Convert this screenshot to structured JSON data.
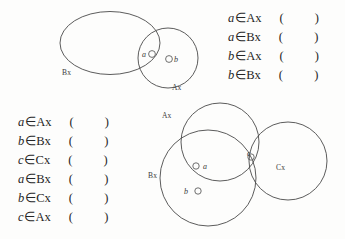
{
  "page": {
    "width": 345,
    "height": 239,
    "background": "#fdfdfc",
    "ink_color": "#3a3a3a",
    "text_color": "#262626"
  },
  "diagrams": {
    "two_set": {
      "name": "two-set-venn-diagram",
      "sets": [
        {
          "id": "Bx",
          "label": "Bx",
          "shape": "ellipse"
        },
        {
          "id": "Ax",
          "label": "Ax",
          "shape": "circle"
        }
      ],
      "points": [
        {
          "id": "a",
          "label": "a",
          "region": "Ax and Bx overlap"
        },
        {
          "id": "b",
          "label": "b",
          "region": "Ax only"
        }
      ]
    },
    "three_set": {
      "name": "three-set-venn-diagram",
      "sets": [
        {
          "id": "Ax",
          "label": "Ax",
          "shape": "circle"
        },
        {
          "id": "Bx",
          "label": "Bx",
          "shape": "circle"
        },
        {
          "id": "Cx",
          "label": "Cx",
          "shape": "circle"
        }
      ],
      "points": [
        {
          "id": "a",
          "label": "a",
          "region": "Ax and Bx overlap"
        },
        {
          "id": "b",
          "label": "b",
          "region": "Bx only"
        },
        {
          "id": "c",
          "label": "c",
          "region": "Ax and Cx overlap"
        }
      ]
    }
  },
  "membership_symbol": "∈",
  "answer_blank": "(  )",
  "lists": {
    "top_right": {
      "name": "membership-statements-top-right",
      "rows": [
        {
          "var": "a",
          "op": "∈",
          "set": "Ax",
          "blank": "(    )"
        },
        {
          "var": "a",
          "op": "∈",
          "set": "Bx",
          "blank": "(    )"
        },
        {
          "var": "b",
          "op": "∈",
          "set": "Ax",
          "blank": "(    )"
        },
        {
          "var": "b",
          "op": "∈",
          "set": "Bx",
          "blank": "(    )"
        }
      ]
    },
    "bottom_left": {
      "name": "membership-statements-bottom-left",
      "rows": [
        {
          "var": "a",
          "op": "∈",
          "set": "Ax",
          "blank": "(    )"
        },
        {
          "var": "b",
          "op": "∈",
          "set": "Bx",
          "blank": "(    )"
        },
        {
          "var": "c",
          "op": "∈",
          "set": "Cx",
          "blank": "(    )"
        },
        {
          "var": "a",
          "op": "∈",
          "set": "Bx",
          "blank": "(    )"
        },
        {
          "var": "b",
          "op": "∈",
          "set": "Cx",
          "blank": "(    )"
        },
        {
          "var": "c",
          "op": "∈",
          "set": "Ax",
          "blank": "(    )"
        }
      ]
    }
  }
}
